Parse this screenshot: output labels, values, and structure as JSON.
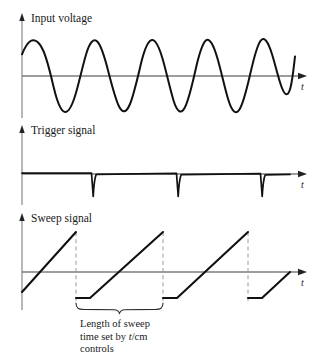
{
  "figure": {
    "type": "waveform-timing-diagram",
    "background": "#ffffff",
    "wave_color": "#111111",
    "axis_color": "#7d7d7d",
    "dashed_color": "#9a9a9a",
    "text_color": "#1a1a1a",
    "width": 331,
    "height": 363
  },
  "panels": [
    {
      "id": "input-voltage",
      "label": "Input voltage",
      "axis_label": "t",
      "waveform": "sine",
      "baseline_y": 76,
      "amplitude": 36,
      "period": 84.5,
      "phase_deg": 37,
      "x_start": 22,
      "x_end": 288,
      "y_axis_x": 22,
      "y_axis_top": 16,
      "y_axis_bottom": 118,
      "x_axis_end": 306
    },
    {
      "id": "trigger-signal",
      "label": "Trigger signal",
      "axis_label": "t",
      "waveform": "negative-spikes",
      "baseline_y": 174,
      "spike_depth": 22,
      "spike_positions": [
        93,
        178,
        262
      ],
      "x_start": 22,
      "x_end": 290,
      "y_axis_x": 22,
      "y_axis_top": 128,
      "y_axis_bottom": 205,
      "x_axis_end": 306
    },
    {
      "id": "sweep-signal",
      "label": "Sweep signal",
      "axis_label": "t",
      "waveform": "sawtooth-ramp",
      "baseline_y": 272,
      "ramp_top_y": 232,
      "ramp_bottom_y": 298,
      "ramp_starts": [
        22,
        93,
        178,
        262
      ],
      "ramp_ends": [
        76,
        163,
        248,
        290
      ],
      "flat_tail_width": 12,
      "y_axis_x": 22,
      "y_axis_top": 216,
      "y_axis_bottom": 310,
      "x_axis_end": 306,
      "dashed_drop_x": [
        76,
        163,
        248
      ],
      "dashed_drop_top": 232,
      "dashed_drop_bottom": 302
    }
  ],
  "annotation": {
    "brace": {
      "x_left": 76,
      "x_right": 163,
      "y": 304,
      "depth": 8
    },
    "caption_lines": [
      "Length of sweep",
      "time set by ",
      "controls"
    ],
    "caption_italic_token": "t",
    "caption_after_italic": "/cm",
    "caption_x": 80,
    "caption_y": 328,
    "caption_line_height": 12.5
  }
}
